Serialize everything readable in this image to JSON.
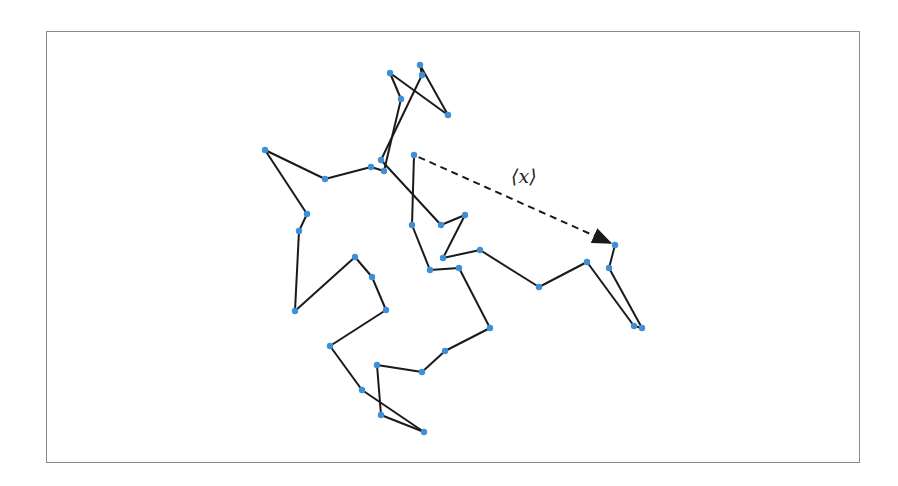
{
  "diagram": {
    "title": "",
    "annotation_label": "⟨x⟩",
    "colors": {
      "node": "#3d8fd6",
      "edge": "#1a1a1a",
      "frame": "#8a8a8a",
      "arrow": "#1a1a1a"
    },
    "nodes": [
      {
        "id": "I",
        "x": 414,
        "y": 155
      },
      {
        "id": "J",
        "x": 412,
        "y": 225
      },
      {
        "id": "O",
        "x": 430,
        "y": 270
      },
      {
        "id": "P",
        "x": 459,
        "y": 268
      },
      {
        "id": "W",
        "x": 490,
        "y": 328
      },
      {
        "id": "AL",
        "x": 445,
        "y": 351
      },
      {
        "id": "AK",
        "x": 422,
        "y": 372
      },
      {
        "id": "AJ",
        "x": 377,
        "y": 365
      },
      {
        "id": "AI",
        "x": 381,
        "y": 415
      },
      {
        "id": "AH",
        "x": 424,
        "y": 432
      },
      {
        "id": "AG",
        "x": 362,
        "y": 390
      },
      {
        "id": "AF",
        "x": 330,
        "y": 346
      },
      {
        "id": "AE",
        "x": 386,
        "y": 310
      },
      {
        "id": "AD",
        "x": 372,
        "y": 277
      },
      {
        "id": "AC",
        "x": 355,
        "y": 257
      },
      {
        "id": "AB",
        "x": 295,
        "y": 311
      },
      {
        "id": "AA",
        "x": 299,
        "y": 231
      },
      {
        "id": "Z",
        "x": 307,
        "y": 214
      },
      {
        "id": "X",
        "x": 265,
        "y": 150
      },
      {
        "id": "Y",
        "x": 325,
        "y": 179
      },
      {
        "id": "H",
        "x": 371,
        "y": 167
      },
      {
        "id": "G",
        "x": 384,
        "y": 171
      },
      {
        "id": "D",
        "x": 401,
        "y": 99
      },
      {
        "id": "A",
        "x": 390,
        "y": 73
      },
      {
        "id": "E",
        "x": 448,
        "y": 115
      },
      {
        "id": "B",
        "x": 420,
        "y": 65
      },
      {
        "id": "C",
        "x": 422,
        "y": 75
      },
      {
        "id": "F",
        "x": 381,
        "y": 160
      },
      {
        "id": "K",
        "x": 441,
        "y": 225
      },
      {
        "id": "L",
        "x": 465,
        "y": 215
      },
      {
        "id": "M",
        "x": 443,
        "y": 258
      },
      {
        "id": "N",
        "x": 480,
        "y": 250
      },
      {
        "id": "Q",
        "x": 539,
        "y": 287
      },
      {
        "id": "R",
        "x": 587,
        "y": 262
      },
      {
        "id": "S",
        "x": 634,
        "y": 326
      },
      {
        "id": "T",
        "x": 642,
        "y": 328
      },
      {
        "id": "U",
        "x": 609,
        "y": 268
      },
      {
        "id": "V",
        "x": 615,
        "y": 245
      }
    ],
    "path_order": [
      "I",
      "J",
      "O",
      "P",
      "W",
      "AL",
      "AK",
      "AJ",
      "AI",
      "AH",
      "AG",
      "AF",
      "AE",
      "AD",
      "AC",
      "AB",
      "AA",
      "Z",
      "X",
      "Y",
      "H",
      "G",
      "D",
      "A",
      "E",
      "B",
      "C",
      "F",
      "K",
      "L",
      "M",
      "N",
      "Q",
      "R",
      "S",
      "T",
      "U",
      "V"
    ],
    "dashed_arrow": {
      "from": "I",
      "to": "V"
    }
  }
}
